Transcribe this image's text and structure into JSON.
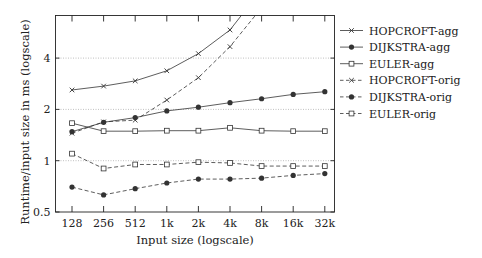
{
  "chart_data": {
    "type": "line",
    "title": "",
    "xlabel": "Input size (logscale)",
    "ylabel": "Runtime/input size in ms (logscale)",
    "xscale": "log2",
    "yscale": "log2",
    "categories": [
      "128",
      "256",
      "512",
      "1k",
      "2k",
      "4k",
      "8k",
      "16k",
      "32k"
    ],
    "yticks": [
      0.5,
      1,
      2,
      4
    ],
    "ytick_labels": [
      "0.5",
      "1",
      "2",
      "4"
    ],
    "ylim": [
      0.5,
      6.9
    ],
    "grid": "horizontal dotted at y ticks",
    "legend_position": "right, outside plot",
    "series": [
      {
        "name": "HOPCROFT-agg",
        "style": "solid",
        "marker": "x",
        "values": [
          2.6,
          2.74,
          2.94,
          3.37,
          4.25,
          5.85,
          10.1,
          null,
          null
        ]
      },
      {
        "name": "DIJKSTRA-agg",
        "style": "solid",
        "marker": "circle",
        "values": [
          1.48,
          1.68,
          1.79,
          1.96,
          2.06,
          2.19,
          2.31,
          2.45,
          2.54
        ]
      },
      {
        "name": "EULER-agg",
        "style": "solid",
        "marker": "square",
        "values": [
          1.66,
          1.49,
          1.49,
          1.5,
          1.5,
          1.56,
          1.5,
          1.49,
          1.49
        ]
      },
      {
        "name": "HOPCROFT-orig",
        "style": "dashed",
        "marker": "x",
        "values": [
          1.45,
          1.69,
          1.73,
          2.27,
          3.07,
          4.67,
          7.9,
          null,
          null
        ]
      },
      {
        "name": "DIJKSTRA-orig",
        "style": "dashed",
        "marker": "circle",
        "values": [
          0.7,
          0.63,
          0.685,
          0.74,
          0.78,
          0.78,
          0.79,
          0.82,
          0.84
        ]
      },
      {
        "name": "EULER-orig",
        "style": "dashed",
        "marker": "square",
        "values": [
          1.1,
          0.9,
          0.95,
          0.95,
          0.98,
          0.97,
          0.93,
          0.93,
          0.93
        ]
      }
    ]
  },
  "colors": {
    "line": "#333333",
    "grid": "#b0b0b0",
    "axis": "#222222"
  }
}
